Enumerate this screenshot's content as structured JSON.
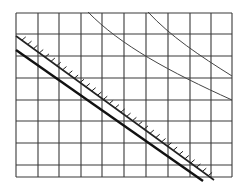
{
  "diagram": {
    "type": "grid-line-diagram",
    "canvas": {
      "width": 251,
      "height": 196,
      "background": "#ffffff"
    },
    "grid": {
      "color": "#3a3a3a",
      "stroke_width": 1.1,
      "x_lines": [
        16,
        38,
        59,
        81,
        102,
        124,
        146,
        168,
        190,
        211,
        232
      ],
      "y_lines": [
        13,
        34,
        56,
        78,
        100,
        121,
        143,
        165,
        177
      ],
      "x_extent": [
        16,
        232
      ],
      "y_extent": [
        13,
        177
      ]
    },
    "curves": [
      {
        "name": "thin-curve-left",
        "color": "#444444",
        "stroke_width": 1.0,
        "path": "M88,12 C120,45 170,72 232,100"
      },
      {
        "name": "thin-curve-right",
        "color": "#444444",
        "stroke_width": 1.0,
        "path": "M148,12 C170,36 200,56 232,76"
      }
    ],
    "hatched_line": {
      "name": "hatched-boundary-line",
      "color": "#222222",
      "stroke_width": 1.6,
      "start": [
        16,
        36
      ],
      "end": [
        214,
        180
      ],
      "tick_count": 34,
      "tick_length": 5,
      "tick_side": "upper-right"
    },
    "thick_line": {
      "name": "thick-line",
      "color": "#111111",
      "stroke_width": 2.4,
      "start": [
        16,
        50
      ],
      "end": [
        203,
        181
      ]
    }
  }
}
